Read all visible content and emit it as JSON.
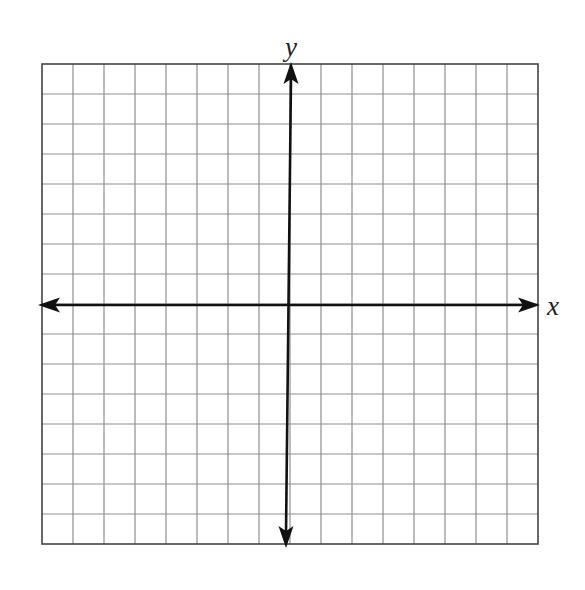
{
  "diagram": {
    "type": "coordinate-grid",
    "grid": {
      "columns": 16,
      "rows": 16,
      "left": 42,
      "top": 64,
      "right": 538,
      "bottom": 544,
      "line_color": "#8f8f8f",
      "border_color": "#444444"
    },
    "axes": {
      "x_axis": {
        "label": "x",
        "y_position": 305,
        "x_start": 38,
        "x_end": 540,
        "color": "#111111"
      },
      "y_axis": {
        "label": "y",
        "x_top": 291,
        "x_bottom": 286,
        "y_start": 62,
        "y_end": 548,
        "color": "#111111"
      },
      "x_label_pos": [
        553,
        315
      ],
      "y_label_pos": [
        291,
        56
      ]
    }
  }
}
